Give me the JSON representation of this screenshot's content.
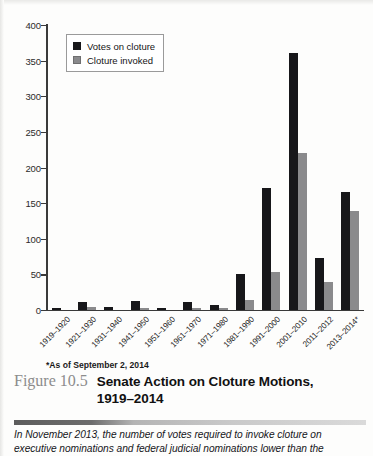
{
  "figure": {
    "number_label": "Figure 10.5",
    "title_line1": "Senate Action on Cloture Motions,",
    "title_line2": "1919–2014",
    "footnote": "*As of September 2, 2014",
    "blurb_line1": "In November 2013, the number of votes required to invoke cloture on",
    "blurb_line2": "executive nominations and federal judicial nominations lower than the"
  },
  "colors": {
    "votes_on_cloture": "#17171a",
    "cloture_invoked": "#8a8a8c",
    "axis": "#3a3a3a"
  },
  "chart_data": {
    "type": "bar",
    "title": "Senate Action on Cloture Motions, 1919–2014",
    "xlabel": "",
    "ylabel": "",
    "ylim": [
      0,
      400
    ],
    "yticks": [
      0,
      50,
      100,
      150,
      200,
      250,
      300,
      350,
      400
    ],
    "grid": false,
    "legend_position": "top-left",
    "categories": [
      "1919–1920",
      "1921–1930",
      "1931–1940",
      "1941–1950",
      "1951–1960",
      "1961–1970",
      "1971–1980",
      "1981–1990",
      "1991–2000",
      "2001–2010",
      "2011–2012",
      "2013–2014*"
    ],
    "series": [
      {
        "name": "Votes on cloture",
        "color": "#17171a",
        "values": [
          1,
          10,
          3,
          12,
          2,
          11,
          7,
          50,
          170,
          360,
          72,
          165
        ]
      },
      {
        "name": "Cloture invoked",
        "color": "#8a8a8c",
        "values": [
          0,
          3,
          0,
          1,
          0,
          1,
          1,
          14,
          52,
          220,
          39,
          138
        ]
      }
    ]
  }
}
